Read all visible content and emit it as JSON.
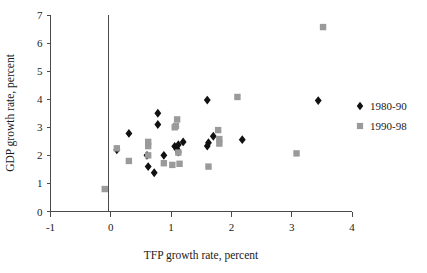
{
  "chart_data": {
    "type": "scatter",
    "title": "",
    "xlabel": "TFP growth rate, percent",
    "ylabel": "GDP growth rate, percent",
    "xlim": [
      -1,
      4
    ],
    "ylim": [
      0,
      7
    ],
    "xticks": [
      -1,
      0,
      1,
      2,
      3,
      4
    ],
    "yticks": [
      0,
      1,
      2,
      3,
      4,
      5,
      6,
      7
    ],
    "xtick_labels": [
      "-1",
      "0",
      "1",
      "2",
      "3",
      "4"
    ],
    "ytick_labels": [
      "0",
      "1",
      "2",
      "3",
      "4",
      "5",
      "6",
      "7"
    ],
    "grid": false,
    "legend_position": "right",
    "zero_reference_line_x": 0,
    "series": [
      {
        "name": "1980-90",
        "marker": "diamond",
        "color": "#111111",
        "points": [
          [
            0.1,
            2.2
          ],
          [
            0.3,
            2.78
          ],
          [
            0.6,
            2.0
          ],
          [
            0.62,
            1.6
          ],
          [
            0.72,
            1.38
          ],
          [
            0.78,
            3.5
          ],
          [
            0.78,
            3.1
          ],
          [
            0.88,
            2.0
          ],
          [
            1.06,
            2.32
          ],
          [
            1.1,
            2.22
          ],
          [
            1.12,
            2.12
          ],
          [
            1.12,
            2.38
          ],
          [
            1.2,
            2.48
          ],
          [
            1.6,
            3.97
          ],
          [
            1.6,
            2.33
          ],
          [
            1.62,
            2.45
          ],
          [
            1.7,
            2.68
          ],
          [
            2.18,
            2.56
          ],
          [
            3.44,
            3.95
          ]
        ]
      },
      {
        "name": "1990-98",
        "marker": "square",
        "color": "#9a9a9a",
        "points": [
          [
            -0.1,
            0.8
          ],
          [
            0.1,
            2.25
          ],
          [
            0.3,
            1.8
          ],
          [
            0.62,
            2.48
          ],
          [
            0.62,
            2.33
          ],
          [
            0.62,
            2.0
          ],
          [
            0.88,
            1.72
          ],
          [
            1.02,
            1.66
          ],
          [
            1.06,
            3.0
          ],
          [
            1.08,
            3.05
          ],
          [
            1.1,
            3.28
          ],
          [
            1.12,
            2.1
          ],
          [
            1.14,
            1.7
          ],
          [
            1.62,
            1.6
          ],
          [
            1.78,
            2.9
          ],
          [
            1.8,
            2.58
          ],
          [
            1.8,
            2.42
          ],
          [
            2.1,
            4.08
          ],
          [
            3.08,
            2.07
          ],
          [
            3.52,
            6.57
          ]
        ]
      }
    ]
  },
  "legend": {
    "entries": [
      {
        "label": "1980-90",
        "marker": "diamond",
        "color": "#111111"
      },
      {
        "label": "1990-98",
        "marker": "square",
        "color": "#9a9a9a"
      }
    ]
  }
}
